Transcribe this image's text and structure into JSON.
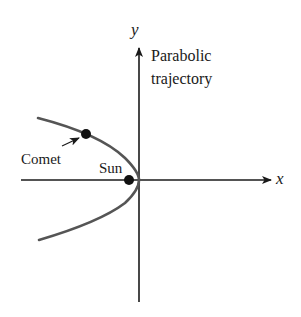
{
  "diagram": {
    "axes": {
      "x_label": "x",
      "y_label": "y"
    },
    "labels": {
      "trajectory_line1": "Parabolic",
      "trajectory_line2": "trajectory",
      "comet": "Comet",
      "sun": "Sun"
    },
    "colors": {
      "axis": "#1a1a1a",
      "curve": "#555555",
      "dot": "#111111"
    }
  }
}
